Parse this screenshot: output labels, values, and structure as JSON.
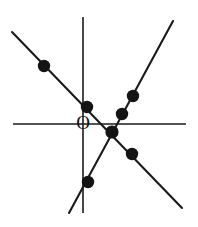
{
  "figure": {
    "origin_label": "O",
    "background_color": "#ffffff",
    "ink_color": "#141414",
    "canvas": {
      "width": 198,
      "height": 227
    }
  },
  "axes": {
    "horizontal": {
      "name": "x-axis",
      "x1": 13,
      "y1": 124,
      "x2": 186,
      "y2": 124
    },
    "vertical": {
      "name": "y-axis",
      "x1": 83,
      "y1": 17,
      "x2": 83,
      "y2": 213
    }
  },
  "lines": [
    {
      "name": "descending-line",
      "label": "line through upper-left and lower-right",
      "x1": 12,
      "y1": 32,
      "x2": 182,
      "y2": 208
    },
    {
      "name": "ascending-line",
      "label": "steep line through lower-left and upper-right",
      "x1": 69,
      "y1": 213,
      "x2": 173,
      "y2": 21
    }
  ],
  "points": [
    {
      "name": "point-upper-left",
      "cx": 44,
      "cy": 66,
      "r": 6.2
    },
    {
      "name": "point-on-y-axis",
      "cx": 87,
      "cy": 107,
      "r": 6.2
    },
    {
      "name": "point-upper-right-high",
      "cx": 133,
      "cy": 96,
      "r": 6.2
    },
    {
      "name": "point-upper-right-low",
      "cx": 122,
      "cy": 114,
      "r": 6.2
    },
    {
      "name": "point-intersection",
      "cx": 112,
      "cy": 132,
      "r": 6.6
    },
    {
      "name": "point-lower-right",
      "cx": 132,
      "cy": 154,
      "r": 6.2
    },
    {
      "name": "point-lower-left",
      "cx": 88,
      "cy": 182,
      "r": 6.2
    }
  ],
  "origin": {
    "x": 83,
    "y": 125
  }
}
